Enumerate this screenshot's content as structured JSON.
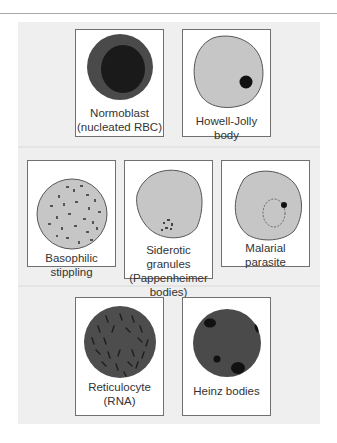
{
  "figure": {
    "rows": [
      {
        "cells": [
          {
            "id": "normoblast",
            "label_lines": [
              "Normoblast",
              "(nucleated RBC)"
            ]
          },
          {
            "id": "howell-jolly",
            "label_lines": [
              "Howell-Jolly body"
            ]
          }
        ]
      },
      {
        "cells": [
          {
            "id": "basophilic-stippling",
            "label_lines": [
              "Basophilic",
              "stippling"
            ]
          },
          {
            "id": "siderotic-granules",
            "label_lines": [
              "Siderotic granules",
              "(Pappenheimer",
              "bodies)"
            ]
          },
          {
            "id": "malarial-parasite",
            "label_lines": [
              "Malarial",
              "parasite"
            ]
          }
        ]
      },
      {
        "cells": [
          {
            "id": "reticulocyte",
            "label_lines": [
              "Reticulocyte",
              "(RNA)"
            ]
          },
          {
            "id": "heinz-bodies",
            "label_lines": [
              "Heinz bodies"
            ]
          }
        ]
      }
    ]
  },
  "colors": {
    "panel_bg": "#efefef",
    "cell_light": "#c6c6c6",
    "cell_dark": "#4a4a4a",
    "inclusion_dark": "#111111"
  }
}
